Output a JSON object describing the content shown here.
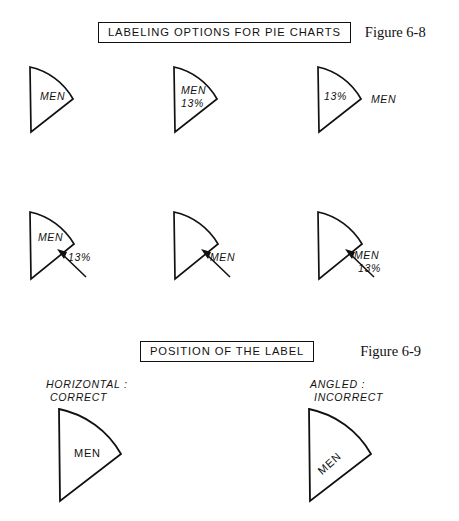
{
  "page": {
    "background_color": "#ffffff",
    "ink_color": "#111111",
    "width": 459,
    "height": 521
  },
  "figure_8": {
    "box_title": "LABELING  OPTIONS FOR PIE CHARTS",
    "figure_number": "Figure 6-8",
    "rows": [
      {
        "row_name": "labels-inside",
        "wedges": [
          {
            "name": "wedge-men-inside",
            "inside_lines": [
              "MEN"
            ],
            "outside_lines": [],
            "has_arrow": false
          },
          {
            "name": "wedge-men-pct-inside",
            "inside_lines": [
              "MEN",
              "13%"
            ],
            "outside_lines": [],
            "has_arrow": false
          },
          {
            "name": "wedge-pct-inside-men-outside",
            "inside_lines": [
              "13%"
            ],
            "outside_lines": [
              "MEN"
            ],
            "has_arrow": false
          }
        ]
      },
      {
        "row_name": "labels-with-arrows",
        "wedges": [
          {
            "name": "wedge-men-inside-pct-arrow",
            "inside_lines": [
              "MEN"
            ],
            "outside_lines": [
              "13%"
            ],
            "has_arrow": true
          },
          {
            "name": "wedge-men-arrow",
            "inside_lines": [],
            "outside_lines": [
              "MEN"
            ],
            "has_arrow": true
          },
          {
            "name": "wedge-men-pct-arrow",
            "inside_lines": [],
            "outside_lines": [
              "MEN",
              "13%"
            ],
            "has_arrow": true
          }
        ]
      }
    ]
  },
  "figure_9": {
    "box_title": "POSITION OF THE LABEL",
    "figure_number": "Figure 6-9",
    "examples": [
      {
        "name": "example-horizontal",
        "heading_lines": [
          "HORIZONTAL :",
          "CORRECT"
        ],
        "wedge_label": "MEN",
        "label_rotation_deg": 0
      },
      {
        "name": "example-angled",
        "heading_lines": [
          "ANGLED :",
          "INCORRECT"
        ],
        "wedge_label": "MEN",
        "label_rotation_deg": -42
      }
    ]
  }
}
